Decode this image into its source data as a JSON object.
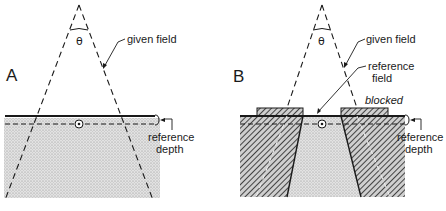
{
  "figure": {
    "panel_a": {
      "letter": "A",
      "angle_label": "θ",
      "given_field_label": "given field",
      "reference_depth_label_line1": "reference",
      "reference_depth_label_line2": "depth"
    },
    "panel_b": {
      "letter": "B",
      "angle_label": "θ",
      "given_field_label": "given field",
      "reference_field_label_line1": "reference",
      "reference_field_label_line2": "field",
      "blocked_label": "blocked",
      "reference_depth_label_line1": "reference",
      "reference_depth_label_line2": "depth"
    },
    "colors": {
      "ink": "#1a1a1a",
      "stipple": "#d9d9d9",
      "hatch_bg": "#bdbdbd"
    }
  }
}
